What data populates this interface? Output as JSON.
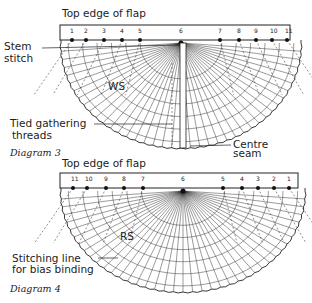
{
  "diagram3": {
    "caption": "Diagram 3",
    "title": "Top edge of flap",
    "side_label": "WS",
    "numbers": [
      "1",
      "2",
      "3",
      "4",
      "5",
      "6",
      "7",
      "8",
      "9",
      "10",
      "11"
    ],
    "annotations": {
      "stem_stitch_line1": "Stem",
      "stem_stitch_line2": "stitch",
      "gathering_line1": "Tied gathering",
      "gathering_line2": "threads",
      "centre_line1": "Centre",
      "centre_line2": "seam"
    }
  },
  "diagram4": {
    "caption": "Diagram 4",
    "title": "Top edge of flap",
    "side_label": "RS",
    "numbers": [
      "11",
      "10",
      "9",
      "8",
      "7",
      "6",
      "5",
      "4",
      "3",
      "2",
      "1"
    ],
    "annotations": {
      "stitching_line1": "Stitching line",
      "stitching_line2": "for bias binding"
    }
  },
  "colors": {
    "ink": "#222222",
    "background": "#ffffff"
  }
}
